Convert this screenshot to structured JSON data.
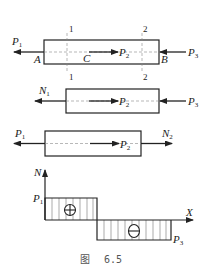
{
  "figure": {
    "caption_prefix": "图",
    "caption_number": "6.5"
  },
  "bar_full": {
    "left_force": {
      "label": "P",
      "sub": "1",
      "direction": "left"
    },
    "middle_force": {
      "label": "P",
      "sub": "2",
      "direction": "right"
    },
    "right_force": {
      "label": "P",
      "sub": "3",
      "direction": "left"
    },
    "point_A": "A",
    "point_B": "B",
    "point_C": "C",
    "section_1_top": "1",
    "section_1_bottom": "1",
    "section_2_top": "2",
    "section_2_bottom": "2"
  },
  "free_body_right": {
    "internal_force": {
      "label": "N",
      "sub": "1",
      "direction": "left"
    },
    "middle_force": {
      "label": "P",
      "sub": "2",
      "direction": "right"
    },
    "right_force": {
      "label": "P",
      "sub": "3",
      "direction": "left"
    }
  },
  "free_body_left": {
    "left_force": {
      "label": "P",
      "sub": "1",
      "direction": "left"
    },
    "middle_force": {
      "label": "P",
      "sub": "2",
      "direction": "right"
    },
    "internal_force": {
      "label": "N",
      "sub": "2",
      "direction": "right"
    }
  },
  "axial_force_diagram": {
    "y_axis_label": "N",
    "x_axis_label": "X",
    "positive_value_label": {
      "label": "P",
      "sub": "1"
    },
    "negative_value_label": {
      "label": "P",
      "sub": "3"
    },
    "positive_sign": "⊕",
    "negative_sign": "⊖",
    "segments": [
      {
        "region": "A-C",
        "sign": "positive",
        "magnitude": "P1"
      },
      {
        "region": "C-B",
        "sign": "negative",
        "magnitude": "P3"
      }
    ]
  }
}
